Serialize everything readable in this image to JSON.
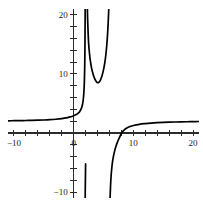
{
  "figure": {
    "kind": "math-function-plot",
    "background_color": "#ffffff",
    "curve_color": "#000000",
    "axis_color": "#2b2b2b",
    "label_color": "#1a1a1a"
  },
  "top_strip": {
    "note": "clipped sliver of a text line at the very top edge",
    "fragments": [
      "",
      "",
      ""
    ]
  },
  "chart_data": {
    "type": "line",
    "title": "",
    "subtitle": "",
    "xlabel": "",
    "ylabel": "",
    "xlim": [
      -11,
      21
    ],
    "ylim": [
      -11,
      21
    ],
    "grid": false,
    "legend": null,
    "axis_style": "cartesian-cross-with-ticks",
    "x_tick_step": 2,
    "y_tick_step": 2,
    "x_tick_labels": [
      {
        "value": -10,
        "text": "−10"
      },
      {
        "value": 0,
        "text": "0"
      },
      {
        "value": 10,
        "text": "10"
      },
      {
        "value": 20,
        "text": "20"
      }
    ],
    "y_tick_labels": [
      {
        "value": -10,
        "text": "−10"
      },
      {
        "value": 10,
        "text": "10"
      },
      {
        "value": 20,
        "text": "20"
      }
    ],
    "x_minor_ticks": [
      -10,
      -8,
      -6,
      -4,
      -2,
      0,
      2,
      4,
      6,
      8,
      10,
      12,
      14,
      16,
      18,
      20
    ],
    "y_minor_ticks": [
      -10,
      -8,
      -6,
      -4,
      -2,
      2,
      4,
      6,
      8,
      10,
      12,
      14,
      16,
      18,
      20
    ],
    "asymptotes": {
      "vertical": [
        2,
        6
      ],
      "horizontal": [
        2
      ]
    },
    "features": {
      "local_minimum": {
        "x": 4.0,
        "y": 8.5
      },
      "x_intercept": 8.0,
      "horizontal_asymptote_value": 2
    },
    "series": [
      {
        "name": "left-branch",
        "comment": "x from -11 up to vertical asymptote at x=2; flat near y=2 then plunges to -infinity",
        "points": [
          [
            -11.0,
            2.07
          ],
          [
            -10.0,
            2.09
          ],
          [
            -9.0,
            2.1
          ],
          [
            -8.0,
            2.12
          ],
          [
            -7.0,
            2.14
          ],
          [
            -6.0,
            2.17
          ],
          [
            -5.0,
            2.21
          ],
          [
            -4.0,
            2.26
          ],
          [
            -3.0,
            2.33
          ],
          [
            -2.0,
            2.44
          ],
          [
            -1.0,
            2.62
          ],
          [
            -0.5,
            2.75
          ],
          [
            0.0,
            2.92
          ],
          [
            0.5,
            3.18
          ],
          [
            0.8,
            3.41
          ],
          [
            1.0,
            3.62
          ],
          [
            1.2,
            3.95
          ],
          [
            1.4,
            4.5
          ],
          [
            1.5,
            4.95
          ],
          [
            1.6,
            5.6
          ],
          [
            1.7,
            6.7
          ],
          [
            1.75,
            7.6
          ],
          [
            1.8,
            8.9
          ],
          [
            1.85,
            11.2
          ],
          [
            1.88,
            13.5
          ],
          [
            1.9,
            15.8
          ],
          [
            1.92,
            19.0
          ],
          [
            1.93,
            21.0
          ]
        ]
      },
      {
        "name": "left-branch-lower",
        "comment": "just right of x=2 the branch re-enters from -infinity is NOT here; this is the downward tail of the left branch drawn below the x-axis near x=2",
        "points": [
          [
            1.93,
            -11.0
          ],
          [
            1.95,
            -9.0
          ],
          [
            1.98,
            -7.0
          ],
          [
            2.0,
            -5.2
          ]
        ]
      },
      {
        "name": "middle-branch",
        "comment": "U-shaped branch between the vertical asymptotes x=2 and x=6; minimum about (4, 8.5)",
        "points": [
          [
            2.3,
            21.0
          ],
          [
            2.35,
            19.0
          ],
          [
            2.42,
            17.0
          ],
          [
            2.52,
            15.0
          ],
          [
            2.65,
            13.5
          ],
          [
            2.8,
            12.2
          ],
          [
            3.0,
            11.0
          ],
          [
            3.25,
            10.0
          ],
          [
            3.5,
            9.25
          ],
          [
            3.75,
            8.75
          ],
          [
            4.0,
            8.52
          ],
          [
            4.25,
            8.62
          ],
          [
            4.5,
            9.0
          ],
          [
            4.75,
            9.7
          ],
          [
            5.0,
            10.7
          ],
          [
            5.2,
            11.8
          ],
          [
            5.4,
            13.3
          ],
          [
            5.55,
            14.9
          ],
          [
            5.68,
            16.7
          ],
          [
            5.78,
            18.6
          ],
          [
            5.86,
            20.4
          ],
          [
            5.9,
            21.5
          ]
        ]
      },
      {
        "name": "right-branch",
        "comment": "rises from -infinity at x=6, crosses the x-axis near x=8, approaches y=2 from below",
        "points": [
          [
            6.1,
            -11.0
          ],
          [
            6.18,
            -9.0
          ],
          [
            6.28,
            -7.2
          ],
          [
            6.42,
            -5.6
          ],
          [
            6.6,
            -4.3
          ],
          [
            6.85,
            -3.1
          ],
          [
            7.1,
            -2.2
          ],
          [
            7.4,
            -1.4
          ],
          [
            7.7,
            -0.7
          ],
          [
            8.0,
            -0.05
          ],
          [
            8.4,
            0.45
          ],
          [
            8.9,
            0.85
          ],
          [
            9.5,
            1.12
          ],
          [
            10.0,
            1.28
          ],
          [
            11.0,
            1.48
          ],
          [
            12.0,
            1.6
          ],
          [
            13.0,
            1.69
          ],
          [
            14.0,
            1.75
          ],
          [
            15.0,
            1.8
          ],
          [
            16.0,
            1.84
          ],
          [
            17.0,
            1.87
          ],
          [
            18.0,
            1.89
          ],
          [
            19.0,
            1.91
          ],
          [
            20.0,
            1.93
          ],
          [
            21.0,
            1.95
          ]
        ]
      }
    ]
  }
}
